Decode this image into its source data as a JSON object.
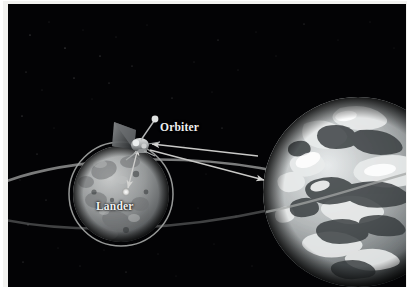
{
  "figure": {
    "kind": "space-mission-diagram",
    "background_color": "#030305",
    "border_color": "#f2f2f0",
    "label_color": "#efefef"
  },
  "labels": {
    "orbiter": "Orbiter",
    "lander": "Lander"
  },
  "bodies": {
    "earth": {
      "name": "Earth",
      "center_x": 350,
      "center_y": 188,
      "radius": 95,
      "color": "#b9bcbd"
    },
    "moon": {
      "name": "Moon",
      "center_x": 113,
      "center_y": 190,
      "radius": 48,
      "color": "#8d8f90"
    }
  },
  "spacecraft": {
    "orbiter": {
      "name": "Orbiter",
      "x": 127,
      "y": 135
    },
    "lander": {
      "name": "Lander",
      "x": 118,
      "y": 188,
      "marker_color": "#d8d8d6"
    }
  },
  "orbits": {
    "lunar_orbit": {
      "name": "lunar-orbit-ring",
      "center_x": 113,
      "center_y": 190,
      "radius": 52,
      "color": "#9a9a98"
    },
    "transfer_orbit": {
      "name": "transfer-ellipse",
      "color": "#9a9a98"
    }
  },
  "links": [
    {
      "name": "orbiter-earth-uplink",
      "from": "Earth",
      "to": "Orbiter",
      "direction": "to-orbiter"
    },
    {
      "name": "orbiter-earth-downlink",
      "from": "Orbiter",
      "to": "Earth",
      "direction": "to-earth"
    },
    {
      "name": "orbiter-lander-link",
      "from": "Orbiter",
      "to": "Lander",
      "direction": "bidirectional"
    }
  ]
}
